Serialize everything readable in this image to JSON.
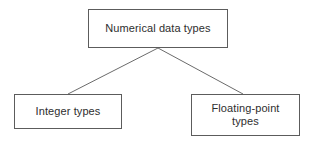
{
  "diagram": {
    "type": "tree",
    "background_color": "#ffffff",
    "border_color": "#5c5c5c",
    "text_color": "#2e2e2e",
    "connector_color": "#6b6b6b",
    "root": {
      "label": "Numerical data types"
    },
    "children": [
      {
        "label": "Integer types"
      },
      {
        "label": "Floating-point\ntypes"
      }
    ]
  }
}
